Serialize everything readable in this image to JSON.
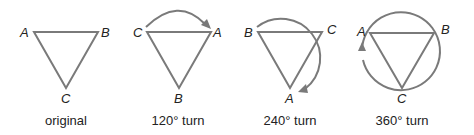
{
  "diagram": {
    "colors": {
      "stroke": "#7a7a7a",
      "text": "#222222",
      "background": "#ffffff"
    },
    "panels": [
      {
        "caption": "original",
        "labels": {
          "top_left": "A",
          "top_right": "B",
          "bottom": "C"
        },
        "rotation_arrow": "none"
      },
      {
        "caption": "120° turn",
        "labels": {
          "top_left": "C",
          "top_right": "A",
          "bottom": "B"
        },
        "rotation_arrow": "arc-clockwise-120"
      },
      {
        "caption": "240° turn",
        "labels": {
          "top_left": "B",
          "top_right": "C",
          "bottom": "A"
        },
        "rotation_arrow": "arc-clockwise-240"
      },
      {
        "caption": "360° turn",
        "labels": {
          "top_left": "A",
          "top_right": "B",
          "bottom": "C"
        },
        "rotation_arrow": "arc-clockwise-360"
      }
    ]
  }
}
